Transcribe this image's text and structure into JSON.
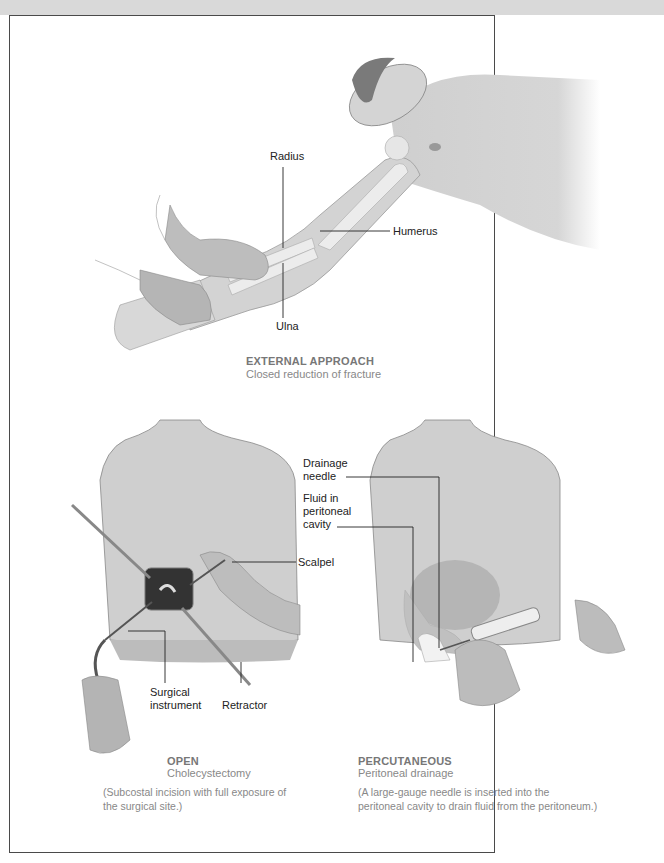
{
  "figure": {
    "panels": [
      {
        "id": "external",
        "title": "EXTERNAL APPROACH",
        "subtitle": "Closed reduction of fracture",
        "labels": [
          "Radius",
          "Humerus",
          "Ulna"
        ]
      },
      {
        "id": "open",
        "title": "OPEN",
        "subtitle": "Cholecystectomy",
        "description": "(Subcostal incision with full exposure of the surgical site.)",
        "labels": [
          "Scalpel",
          "Surgical instrument",
          "Retractor"
        ]
      },
      {
        "id": "percutaneous",
        "title": "PERCUTANEOUS",
        "subtitle": "Peritoneal drainage",
        "description": "(A large-gauge needle is inserted into the peritoneal cavity to drain fluid from the peritoneum.)",
        "labels": [
          "Drainage needle",
          "Fluid in peritoneal cavity"
        ]
      }
    ]
  },
  "labels": {
    "radius": "Radius",
    "humerus": "Humerus",
    "ulna": "Ulna",
    "drainage_1": "Drainage",
    "drainage_2": "needle",
    "fluid_1": "Fluid in",
    "fluid_2": "peritoneal",
    "fluid_3": "cavity",
    "scalpel": "Scalpel",
    "surgical_1": "Surgical",
    "surgical_2": "instrument",
    "retractor": "Retractor"
  },
  "captions": {
    "external_title": "EXTERNAL APPROACH",
    "external_sub": "Closed reduction of fracture",
    "open_title": "OPEN",
    "open_sub": "Cholecystectomy",
    "open_desc": "(Subcostal incision with full exposure of the surgical site.)",
    "perc_title": "PERCUTANEOUS",
    "perc_sub": "Peritoneal drainage",
    "perc_desc": "(A large-gauge needle is inserted into the peritoneal cavity to drain fluid from the peritoneum.)"
  },
  "colors": {
    "skin": "#cfcfcf",
    "skin_dark": "#a9a9a9",
    "bone": "#e6e6e6",
    "frame": "#4a4a4a",
    "caption": "#888888"
  }
}
